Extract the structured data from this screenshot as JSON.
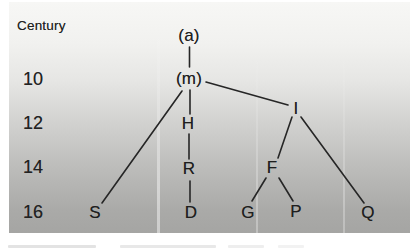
{
  "figure": {
    "kind": "stemma-tree-diagram"
  },
  "axis": {
    "title": "Century",
    "ticks": [
      "10",
      "12",
      "14",
      "16"
    ]
  },
  "tree": {
    "nodes": [
      {
        "id": "a",
        "label": "(a)",
        "century": "pre-10"
      },
      {
        "id": "m",
        "label": "(m)",
        "century": "10"
      },
      {
        "id": "H",
        "label": "H",
        "century": "12"
      },
      {
        "id": "I",
        "label": "I",
        "century": "12"
      },
      {
        "id": "R",
        "label": "R",
        "century": "14"
      },
      {
        "id": "F",
        "label": "F",
        "century": "14"
      },
      {
        "id": "S",
        "label": "S",
        "century": "16"
      },
      {
        "id": "D",
        "label": "D",
        "century": "16"
      },
      {
        "id": "G",
        "label": "G",
        "century": "16"
      },
      {
        "id": "P",
        "label": "P",
        "century": "16"
      },
      {
        "id": "Q",
        "label": "Q",
        "century": "16"
      }
    ],
    "edges": [
      [
        "a",
        "m"
      ],
      [
        "m",
        "S"
      ],
      [
        "m",
        "H"
      ],
      [
        "m",
        "I"
      ],
      [
        "H",
        "R"
      ],
      [
        "R",
        "D"
      ],
      [
        "I",
        "F"
      ],
      [
        "I",
        "Q"
      ],
      [
        "F",
        "G"
      ],
      [
        "F",
        "P"
      ]
    ]
  },
  "colors": {
    "page": "#ffffff",
    "panel_top": "#f7f7f5",
    "panel_bottom": "#a5a5a3",
    "ink": "#1e1e1e"
  }
}
